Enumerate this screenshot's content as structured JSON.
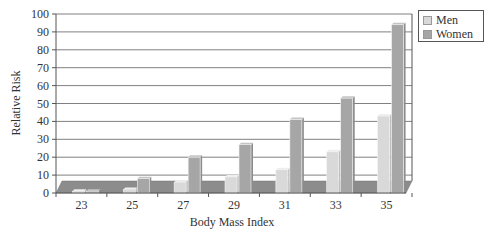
{
  "chart_data": {
    "type": "bar",
    "style": "3d-clustered",
    "title": "",
    "xlabel": "Body Mass Index",
    "ylabel": "Relative Risk",
    "categories": [
      "23",
      "25",
      "27",
      "29",
      "31",
      "33",
      "35"
    ],
    "series": [
      {
        "name": "Men",
        "color": "#d9d9d9",
        "values": [
          1,
          2,
          6,
          9,
          13,
          23,
          43
        ]
      },
      {
        "name": "Women",
        "color": "#a6a6a6",
        "values": [
          1,
          8,
          20,
          27,
          41,
          53,
          94
        ]
      }
    ],
    "ylim": [
      0,
      100
    ],
    "yticks": [
      0,
      10,
      20,
      30,
      40,
      50,
      60,
      70,
      80,
      90,
      100
    ],
    "grid": true,
    "legend_position": "top-right"
  },
  "legend": {
    "items": [
      {
        "label": "Men",
        "color": "#d9d9d9"
      },
      {
        "label": "Women",
        "color": "#a6a6a6"
      }
    ]
  },
  "colors": {
    "floor": "#8c8c8c",
    "gridline": "#808080",
    "axis": "#555555"
  }
}
